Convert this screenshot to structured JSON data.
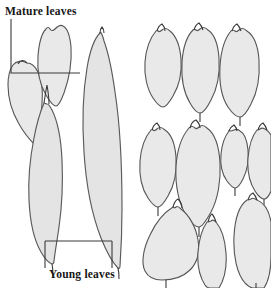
{
  "figure": {
    "background_color": "#ffffff",
    "width": 271,
    "height": 288
  },
  "annotations": {
    "mature_label": "Mature leaves",
    "young_label": "Young leaves"
  },
  "style": {
    "leaf_fill": "#e9e9e9",
    "leaf_stroke": "#555555",
    "leader_stroke": "#3a3a3a",
    "text_color": "#161616"
  },
  "leaf_groups": [
    {
      "name": "left-column-outline-leaves",
      "description": "Four large outlined leaves at varying scale on the left half, annotated with Mature leaves and Young leaves callouts",
      "count": 4,
      "leaves": [
        {
          "id": "left-mature-1",
          "shape": "ovate-acuminate",
          "size": "medium"
        },
        {
          "id": "left-mature-2",
          "shape": "obovate-truncate",
          "size": "medium"
        },
        {
          "id": "left-long-1",
          "shape": "lanceolate-elongate",
          "size": "large"
        },
        {
          "id": "left-long-2",
          "shape": "linear-lanceolate",
          "size": "extra-large"
        }
      ]
    },
    {
      "name": "right-grid-leaves",
      "description": "Ten filled leaf silhouettes arranged in three rows on the right half",
      "count": 10,
      "rows": [
        {
          "row": 1,
          "leaves": [
            {
              "id": "r1c1",
              "shape": "elliptic-apiculate",
              "size": "medium"
            },
            {
              "id": "r1c2",
              "shape": "ovate-apiculate",
              "size": "medium-large"
            },
            {
              "id": "r1c3",
              "shape": "oblong-apiculate",
              "size": "large"
            }
          ]
        },
        {
          "row": 2,
          "leaves": [
            {
              "id": "r2c1",
              "shape": "elliptic-apiculate",
              "size": "medium"
            },
            {
              "id": "r2c2",
              "shape": "broad-elliptic",
              "size": "large"
            },
            {
              "id": "r2c3",
              "shape": "small-elliptic",
              "size": "small"
            },
            {
              "id": "r2c4",
              "shape": "narrow-elliptic",
              "size": "small-medium"
            }
          ]
        },
        {
          "row": 3,
          "leaves": [
            {
              "id": "r3c1",
              "shape": "obovate-apiculate",
              "size": "large"
            },
            {
              "id": "r3c2",
              "shape": "narrow-elliptic",
              "size": "medium"
            },
            {
              "id": "r3c3",
              "shape": "oblong-rounded",
              "size": "large"
            }
          ]
        }
      ]
    }
  ]
}
